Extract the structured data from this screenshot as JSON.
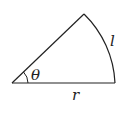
{
  "diagram": {
    "type": "circular-sector",
    "labels": {
      "angle": "θ",
      "arc": "l",
      "radius": "r"
    },
    "stroke_color": "#222222"
  }
}
